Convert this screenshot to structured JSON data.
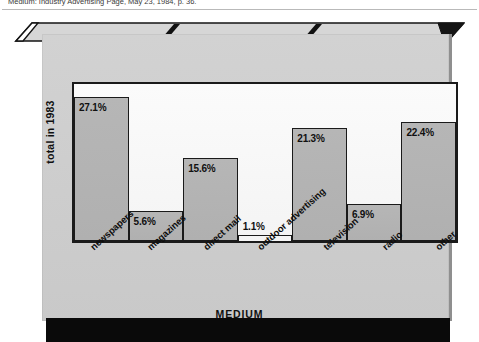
{
  "caption": "Medium: Industry Advertising Page, May 23, 1984, p. 36.",
  "chart_data": {
    "type": "bar",
    "title": "",
    "xlabel": "MEDIUM",
    "ylabel": "total in 1983",
    "categories": [
      "newspapers",
      "magazines",
      "direct mail",
      "outdoor advertising",
      "television",
      "radio",
      "other"
    ],
    "values": [
      27.1,
      5.6,
      15.6,
      1.1,
      21.3,
      6.9,
      22.4
    ],
    "value_labels": [
      "27.1%",
      "5.6%",
      "15.6%",
      "1.1%",
      "21.3%",
      "6.9%",
      "22.4%"
    ],
    "unit": "%",
    "ylim": [
      0,
      29.5
    ],
    "grid": false,
    "legend": "none",
    "bar_fill": "#b3b3b3",
    "bar_stroke": "#1a1a1a",
    "plot_background": "#f7f7f7",
    "panel_background": "#cdcdcd",
    "base_color": "#0a0a0a"
  }
}
